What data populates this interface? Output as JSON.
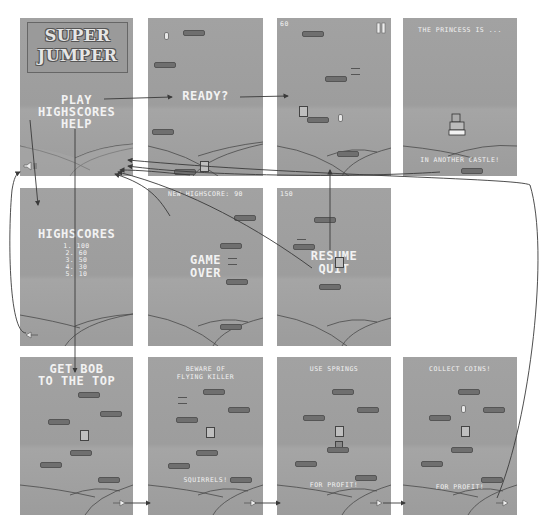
{
  "diagram": {
    "screens": {
      "main_menu": {
        "logo_line1": "SUPER",
        "logo_line2": "JUMPER",
        "menu_items": [
          "PLAY",
          "HIGHSCORES",
          "HELP"
        ],
        "sound_icon": "speaker-icon"
      },
      "ready": {
        "label": "READY?"
      },
      "running": {
        "score": "60",
        "pause_icon": "pause-icon"
      },
      "level_end": {
        "top_text": "THE PRINCESS IS ...",
        "bottom_text": "IN ANOTHER CASTLE!"
      },
      "highscores": {
        "title": "HIGHSCORES",
        "entries": [
          "1. 100",
          "2. 60",
          "3. 50",
          "4. 30",
          "5. 10"
        ],
        "back_icon": "arrow-left-icon"
      },
      "game_over": {
        "top_text": "NEW HIGHSCORE: 90",
        "line1": "GAME",
        "line2": "OVER"
      },
      "paused": {
        "score": "150",
        "menu_items": [
          "RESUME",
          "QUIT"
        ]
      },
      "help1": {
        "line1": "GET BOB",
        "line2": "TO THE TOP",
        "next_icon": "arrow-right-icon"
      },
      "help2": {
        "line1": "BEWARE OF",
        "line2": "FLYING KILLER",
        "bottom": "SQUIRRELS!",
        "next_icon": "arrow-right-icon"
      },
      "help3": {
        "top": "USE SPRINGS",
        "bottom": "FOR PROFIT!",
        "next_icon": "arrow-right-icon"
      },
      "help4": {
        "top": "COLLECT COINS!",
        "bottom": "FOR PROFIT!",
        "next_icon": "arrow-right-icon"
      }
    },
    "colors": {
      "panel": "#9b9b9b",
      "text": "#f2f2f2",
      "line": "#3a3a3a",
      "background": "#ffffff"
    }
  }
}
